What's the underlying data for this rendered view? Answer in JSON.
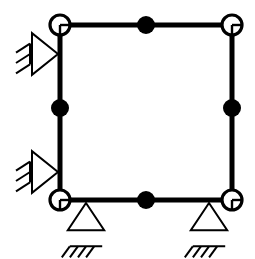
{
  "diagram": {
    "type": "structural-frame-schematic",
    "background_color": "#ffffff",
    "line_color": "#000000",
    "member_stroke_width": 5,
    "thin_stroke_width": 2,
    "canvas": {
      "width": 255,
      "height": 259
    },
    "geometry": {
      "left_x": 60,
      "right_x": 232,
      "top_y": 25,
      "bottom_y": 200,
      "mid_x": 146,
      "mid_y": 112
    },
    "members": [
      {
        "name": "top-beam",
        "label": "Top beam",
        "x1": 60,
        "y1": 25,
        "x2": 232,
        "y2": 25
      },
      {
        "name": "bottom-beam",
        "label": "Bottom beam",
        "x1": 60,
        "y1": 200,
        "x2": 232,
        "y2": 200
      },
      {
        "name": "left-column",
        "label": "Left column",
        "x1": 60,
        "y1": 25,
        "x2": 60,
        "y2": 200
      },
      {
        "name": "right-column",
        "label": "Right column",
        "x1": 232,
        "y1": 25,
        "x2": 232,
        "y2": 200
      }
    ],
    "nodes": [
      {
        "name": "node-top-left",
        "label": "Top-left hinge node",
        "kind": "hinge-circle",
        "cx": 60,
        "cy": 25,
        "r": 10
      },
      {
        "name": "node-top-right",
        "label": "Top-right hinge node",
        "kind": "hinge-circle",
        "cx": 232,
        "cy": 25,
        "r": 10
      },
      {
        "name": "node-bottom-left",
        "label": "Bottom-left hinge node",
        "kind": "hinge-circle",
        "cx": 60,
        "cy": 200,
        "r": 10
      },
      {
        "name": "node-bottom-right",
        "label": "Bottom-right hinge node",
        "kind": "hinge-circle",
        "cx": 232,
        "cy": 200,
        "r": 10
      },
      {
        "name": "node-top-mid",
        "label": "Top mid rigid node",
        "kind": "filled-circle",
        "cx": 146,
        "cy": 25,
        "r": 9
      },
      {
        "name": "node-bottom-mid",
        "label": "Bottom mid rigid node",
        "kind": "filled-circle",
        "cx": 146,
        "cy": 200,
        "r": 9
      },
      {
        "name": "node-left-mid",
        "label": "Left column mid rigid node",
        "kind": "filled-circle",
        "cx": 60,
        "cy": 108,
        "r": 9
      },
      {
        "name": "node-right-mid",
        "label": "Right column mid rigid node",
        "kind": "filled-circle",
        "cx": 232,
        "cy": 108,
        "r": 9
      }
    ],
    "supports": [
      {
        "name": "support-left-upper",
        "label": "Left upper horizontal roller support",
        "kind": "horizontal-roller-with-hatch",
        "apex_x": 58,
        "apex_y": 54,
        "size": 26,
        "hatch_lines": 3
      },
      {
        "name": "support-left-lower",
        "label": "Left lower horizontal roller support",
        "kind": "horizontal-roller-with-hatch",
        "apex_x": 58,
        "apex_y": 172,
        "size": 26,
        "hatch_lines": 3
      },
      {
        "name": "support-bottom-left",
        "label": "Bottom-left pin support with ground",
        "kind": "vertical-pin-with-ground",
        "apex_x": 86,
        "apex_y": 203,
        "size": 26,
        "hatch_lines": 3
      },
      {
        "name": "support-bottom-right",
        "label": "Bottom-right pin support with ground",
        "kind": "vertical-pin-with-ground",
        "apex_x": 209,
        "apex_y": 203,
        "size": 26,
        "hatch_lines": 3
      }
    ]
  }
}
